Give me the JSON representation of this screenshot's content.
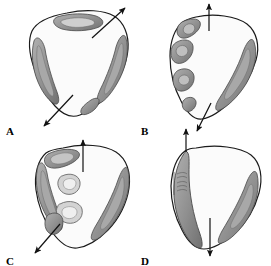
{
  "figure": {
    "kind": "anatomical-cross-section-series",
    "panel_count": 4,
    "background_color": "#ffffff",
    "outline_color": "#1a1a1a",
    "interior_fill": "#fbfbfb",
    "shade_mid": "#9a9a9a",
    "shade_dark": "#6e6e6e",
    "shade_light": "#c9c9c9",
    "arrow_color": "#111111"
  },
  "panels": [
    {
      "id": "A",
      "label": "A",
      "label_x": 6,
      "label_y": 126,
      "arrows": [
        {
          "name": "upper-right-arrow",
          "direction": "up-right",
          "x1": 92,
          "y1": 38,
          "x2": 127,
          "y2": 6
        },
        {
          "name": "lower-left-arrow",
          "direction": "down-left",
          "x1": 73,
          "y1": 95,
          "x2": 42,
          "y2": 128
        }
      ],
      "masses": [
        {
          "name": "superior-mass",
          "position": "top-center"
        },
        {
          "name": "left-lateral-mass",
          "position": "left"
        },
        {
          "name": "right-lateral-mass",
          "position": "right"
        },
        {
          "name": "inferior-right-mass",
          "position": "bottom-right"
        }
      ]
    },
    {
      "id": "B",
      "label": "B",
      "label_x": 141,
      "label_y": 126,
      "arrows": [
        {
          "name": "superior-vertical-arrow",
          "direction": "up",
          "x1": 209,
          "y1": 31,
          "x2": 209,
          "y2": 3
        },
        {
          "name": "inferior-arrow",
          "direction": "down-left",
          "x1": 210,
          "y1": 103,
          "x2": 196,
          "y2": 132
        }
      ],
      "masses": [
        {
          "name": "left-superior-mass",
          "position": "upper-left"
        },
        {
          "name": "left-middle-mass",
          "position": "mid-left"
        },
        {
          "name": "left-inferior-mass",
          "position": "lower-left"
        },
        {
          "name": "left-basal-mass",
          "position": "bottom-left"
        },
        {
          "name": "right-lateral-mass",
          "position": "right"
        }
      ]
    },
    {
      "id": "C",
      "label": "C",
      "label_x": 6,
      "label_y": 256,
      "arrows": [
        {
          "name": "superior-vertical-arrow",
          "direction": "up",
          "x1": 83,
          "y1": 172,
          "x2": 83,
          "y2": 139
        },
        {
          "name": "inferior-left-arrow",
          "direction": "down-left",
          "x1": 60,
          "y1": 224,
          "x2": 34,
          "y2": 254
        }
      ],
      "masses": [
        {
          "name": "superior-left-mass",
          "position": "top-left"
        },
        {
          "name": "left-lateral-mass",
          "position": "left"
        },
        {
          "name": "inner-upper-nodule",
          "position": "inner-upper-left"
        },
        {
          "name": "inner-lower-nodule",
          "position": "inner-mid-left"
        },
        {
          "name": "lower-left-mass",
          "position": "lower-left"
        },
        {
          "name": "right-lateral-mass",
          "position": "right"
        }
      ]
    },
    {
      "id": "D",
      "label": "D",
      "label_x": 141,
      "label_y": 256,
      "arrows": [
        {
          "name": "superior-vertical-arrow",
          "direction": "up",
          "x1": 186,
          "y1": 152,
          "x2": 186,
          "y2": 128
        },
        {
          "name": "inferior-vertical-arrow",
          "direction": "down",
          "x1": 210,
          "y1": 218,
          "x2": 210,
          "y2": 258
        }
      ],
      "masses": [
        {
          "name": "left-broad-mass",
          "position": "left-full-height"
        },
        {
          "name": "right-lateral-mass",
          "position": "right"
        },
        {
          "name": "left-striation-detail",
          "position": "mid-left-inner"
        }
      ]
    }
  ]
}
